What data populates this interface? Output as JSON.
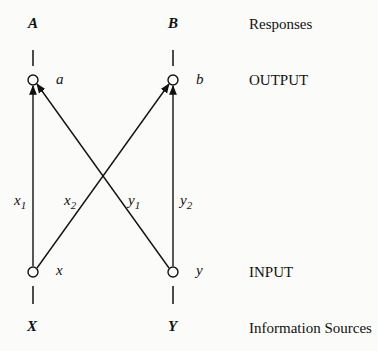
{
  "diagram": {
    "type": "network",
    "nodes": [
      {
        "id": "a",
        "label": "a",
        "layer": "output"
      },
      {
        "id": "b",
        "label": "b",
        "layer": "output"
      },
      {
        "id": "x",
        "label": "x",
        "layer": "input"
      },
      {
        "id": "y",
        "label": "y",
        "layer": "input"
      }
    ],
    "top_labels": {
      "left": "A",
      "right": "B"
    },
    "bottom_labels": {
      "left": "X",
      "right": "Y"
    },
    "edges": [
      {
        "from": "x",
        "to": "a",
        "label": "x",
        "sub": "1"
      },
      {
        "from": "x",
        "to": "b",
        "label": "x",
        "sub": "2"
      },
      {
        "from": "y",
        "to": "a",
        "label": "y",
        "sub": "1"
      },
      {
        "from": "y",
        "to": "b",
        "label": "y",
        "sub": "2"
      }
    ],
    "row_labels": {
      "responses": "Responses",
      "output": "OUTPUT",
      "input": "INPUT",
      "sources": "Information Sources"
    }
  }
}
